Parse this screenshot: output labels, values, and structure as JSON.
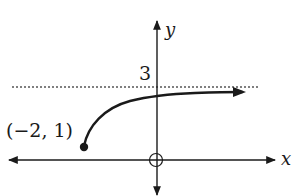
{
  "figure": {
    "type": "function-graph-sketch",
    "axes": {
      "x_label": "x",
      "y_label": "y"
    },
    "asymptote": {
      "label": "3",
      "value": 3,
      "style": "dotted"
    },
    "start_point": {
      "label": "(−2, 1)",
      "x": -2,
      "y": 1,
      "marker": "closed-dot"
    },
    "origin_marker": "open-circle",
    "curve_end": "arrow-right",
    "colors": {
      "ink": "#1a1a1a",
      "dotted": "#555555",
      "background": "#ffffff"
    }
  }
}
